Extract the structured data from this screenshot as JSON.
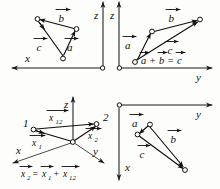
{
  "figure": {
    "ink_color": "#111111",
    "background_color": "#fdfdfc"
  },
  "panels": [
    {
      "id": "top-left",
      "name": "xz-projection-panel",
      "axes": [
        {
          "name": "x-axis",
          "label": "x",
          "direction": "left"
        },
        {
          "name": "z-axis",
          "label": "z",
          "direction": "up"
        }
      ],
      "vectors": [
        {
          "name": "vector-b",
          "label": "b"
        },
        {
          "name": "vector-c",
          "label": "c"
        },
        {
          "name": "vector-a",
          "label": "a"
        }
      ]
    },
    {
      "id": "top-right",
      "name": "yz-projection-panel",
      "axes": [
        {
          "name": "y-axis",
          "label": "y",
          "direction": "right"
        },
        {
          "name": "z-axis",
          "label": "z",
          "direction": "up"
        }
      ],
      "vectors": [
        {
          "name": "vector-b",
          "label": "b"
        },
        {
          "name": "vector-a",
          "label": "a"
        },
        {
          "name": "vector-c",
          "label": "c"
        }
      ],
      "equation": {
        "name": "vector-sum-equation",
        "terms": [
          "a",
          "b",
          "c"
        ],
        "plain": "a + b = c"
      }
    },
    {
      "id": "bottom-left",
      "name": "xyz-position-vector-panel",
      "axes": [
        {
          "name": "x-axis",
          "label": "x",
          "direction": "down-left"
        },
        {
          "name": "y-axis",
          "label": "y",
          "direction": "down-right"
        },
        {
          "name": "z-axis",
          "label": "z",
          "direction": "up"
        }
      ],
      "points": [
        {
          "name": "point-1",
          "label": "1"
        },
        {
          "name": "point-2",
          "label": "2"
        }
      ],
      "vectors": [
        {
          "name": "vector-x12",
          "label": "x",
          "subscript": "12"
        },
        {
          "name": "vector-x1",
          "label": "x",
          "subscript": "1"
        },
        {
          "name": "vector-x2",
          "label": "x",
          "subscript": "2"
        }
      ],
      "equation": {
        "name": "position-vector-equation",
        "plain": "x2 = x1 + x12",
        "terms": [
          {
            "base": "x",
            "sub": "2"
          },
          {
            "base": "x",
            "sub": "1"
          },
          {
            "base": "x",
            "sub": "12"
          }
        ]
      }
    },
    {
      "id": "bottom-right",
      "name": "xy-projection-panel",
      "axes": [
        {
          "name": "y-axis",
          "label": "y",
          "direction": "right"
        },
        {
          "name": "x-axis",
          "label": "x",
          "direction": "down"
        }
      ],
      "vectors": [
        {
          "name": "vector-a",
          "label": "a"
        },
        {
          "name": "vector-b",
          "label": "b"
        },
        {
          "name": "vector-c",
          "label": "c"
        }
      ]
    }
  ],
  "axis_labels": {
    "x": "x",
    "y": "y",
    "z": "z"
  },
  "vector_labels": {
    "a": "a",
    "b": "b",
    "c": "c",
    "x": "x"
  },
  "point_labels": {
    "one": "1",
    "two": "2"
  },
  "subscripts": {
    "one": "1",
    "two": "2",
    "twelve": "12"
  },
  "operators": {
    "plus": "+",
    "equals": "="
  }
}
